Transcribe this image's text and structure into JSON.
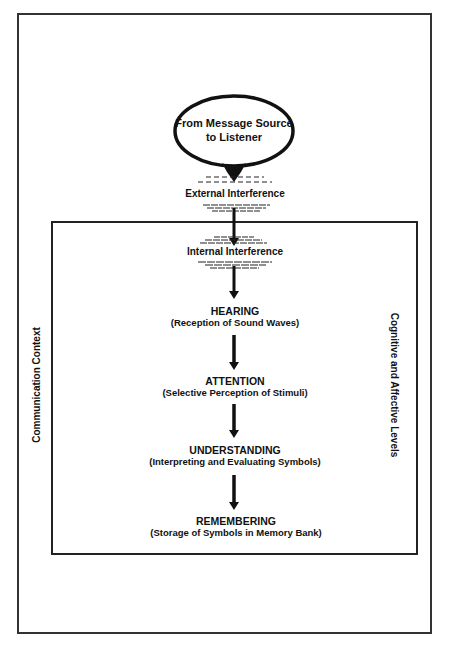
{
  "diagram": {
    "source": {
      "line1": "From Message Source",
      "line2": "to Listener"
    },
    "external_interference": "External Interference",
    "internal_interference": "Internal Interference",
    "context_label": "Communication Context",
    "levels_label": "Cognitive and Affective Levels",
    "stages": [
      {
        "title": "HEARING",
        "subtitle": "(Reception of Sound Waves)"
      },
      {
        "title": "ATTENTION",
        "subtitle": "(Selective Perception of Stimuli)"
      },
      {
        "title": "UNDERSTANDING",
        "subtitle": "(Interpreting and Evaluating Symbols)"
      },
      {
        "title": "REMEMBERING",
        "subtitle": "(Storage of Symbols in Memory Bank)"
      }
    ]
  }
}
